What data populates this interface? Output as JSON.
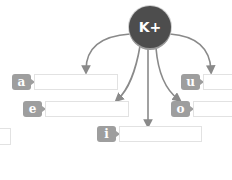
{
  "ion": {
    "label": "K+",
    "fill": "#4d4d4d"
  },
  "arrow_color": "#8a8a8a",
  "tag_color": "#9e9e9e",
  "slots": [
    {
      "tag": "a",
      "value": ""
    },
    {
      "tag": "e",
      "value": ""
    },
    {
      "tag": "i",
      "value": ""
    },
    {
      "tag": "u",
      "value": ""
    },
    {
      "tag": "o",
      "value": ""
    }
  ]
}
